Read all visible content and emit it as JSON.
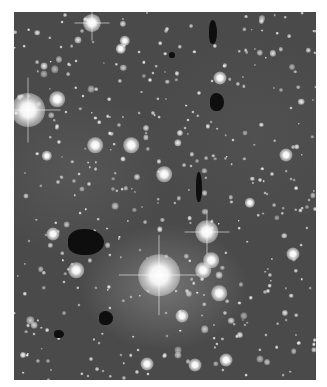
{
  "image": {
    "description": "Grayscale astronomical photograph of a dense star field with dark globules and a bright star near center-bottom",
    "background_color": "#ffffff",
    "field_color": "#4a4a4a",
    "frame": {
      "x": 14,
      "y": 12,
      "width": 302,
      "height": 368
    }
  },
  "bright_stars": [
    {
      "x": 78,
      "y": 11,
      "r": 7,
      "spikes": true
    },
    {
      "x": 14,
      "y": 98,
      "r": 13,
      "spikes": true
    },
    {
      "x": 43,
      "y": 87,
      "r": 6
    },
    {
      "x": 117,
      "y": 133,
      "r": 6
    },
    {
      "x": 81,
      "y": 133,
      "r": 6
    },
    {
      "x": 150,
      "y": 162,
      "r": 6
    },
    {
      "x": 145,
      "y": 263,
      "r": 16,
      "spikes": true
    },
    {
      "x": 193,
      "y": 220,
      "r": 9,
      "spikes": true
    },
    {
      "x": 197,
      "y": 248,
      "r": 6
    },
    {
      "x": 189,
      "y": 258,
      "r": 6
    },
    {
      "x": 272,
      "y": 143,
      "r": 5
    },
    {
      "x": 206,
      "y": 66,
      "r": 5
    },
    {
      "x": 279,
      "y": 242,
      "r": 5
    },
    {
      "x": 205,
      "y": 281,
      "r": 6
    },
    {
      "x": 168,
      "y": 304,
      "r": 5
    },
    {
      "x": 39,
      "y": 222,
      "r": 5
    },
    {
      "x": 62,
      "y": 258,
      "r": 6
    },
    {
      "x": 212,
      "y": 348,
      "r": 5
    },
    {
      "x": 181,
      "y": 353,
      "r": 5
    },
    {
      "x": 133,
      "y": 352,
      "r": 5
    },
    {
      "x": 107,
      "y": 37,
      "r": 4
    },
    {
      "x": 111,
      "y": 29,
      "r": 4
    },
    {
      "x": 33,
      "y": 144,
      "r": 4
    },
    {
      "x": 236,
      "y": 191,
      "r": 4
    }
  ],
  "dark_globules": [
    {
      "x": 199,
      "y": 20,
      "w": 8,
      "h": 24
    },
    {
      "x": 158,
      "y": 43,
      "w": 6,
      "h": 6
    },
    {
      "x": 203,
      "y": 90,
      "w": 14,
      "h": 18
    },
    {
      "x": 185,
      "y": 175,
      "w": 6,
      "h": 30
    },
    {
      "x": 72,
      "y": 230,
      "w": 36,
      "h": 26
    },
    {
      "x": 92,
      "y": 306,
      "w": 14,
      "h": 14
    },
    {
      "x": 45,
      "y": 322,
      "w": 10,
      "h": 8
    }
  ],
  "faint_star_seed": 1337,
  "faint_star_count": 420
}
